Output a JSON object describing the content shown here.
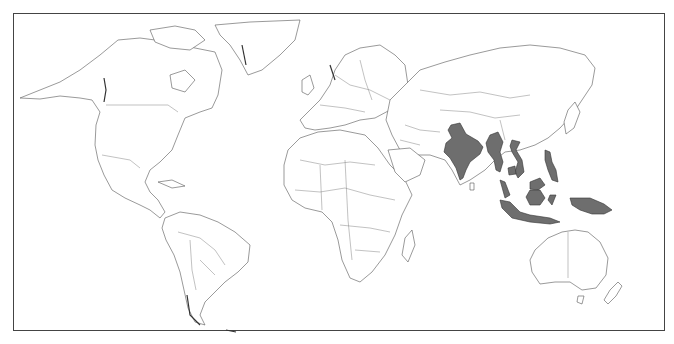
{
  "map": {
    "title": "World map with highlighted countries",
    "projection": "equirectangular-like world outline",
    "colors": {
      "background": "#ffffff",
      "land_fill": "#ffffff",
      "border_stroke": "#555555",
      "highlight_fill": "#6e6e6e",
      "frame": "#444444"
    },
    "highlighted_countries": [
      "India",
      "Myanmar",
      "Vietnam",
      "Cambodia",
      "Malaysia",
      "Philippines",
      "Indonesia",
      "Papua New Guinea"
    ],
    "legend": null
  }
}
